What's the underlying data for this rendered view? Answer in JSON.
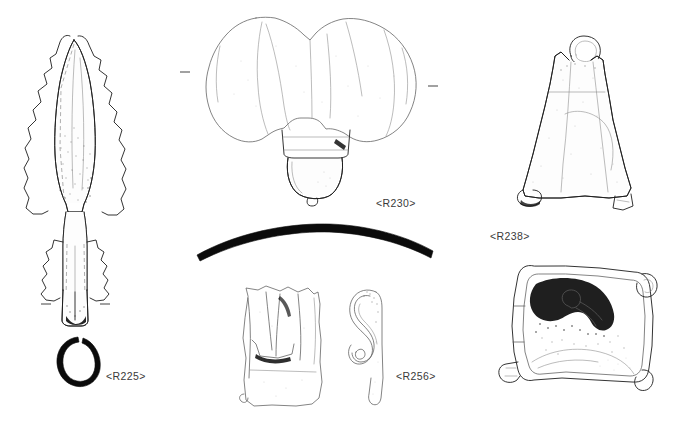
{
  "plate": {
    "title": "Archaeological small finds illustration plate",
    "background_color": "#ffffff",
    "ink_color": "#1d1d1d",
    "label_color": "#3a3a3a",
    "width": 677,
    "height": 435,
    "technique": "pen-and-ink stipple and line drawing"
  },
  "figures": [
    {
      "id": "R225",
      "label": "<R225>",
      "object_name": "socketed spearhead",
      "views": [
        "plan view",
        "socket cross-section"
      ],
      "description": "Leaf-shaped socketed spearhead with corroded irregular edges, midrib indicated by dashed construction lines and a closed socket with a split seam.",
      "label_position": {
        "x": 106,
        "y": 370
      },
      "notes": "Tick marks flank the socket base; annular black cross-section below."
    },
    {
      "id": "R230",
      "label": "<R230>",
      "object_name": "bi-lobed mount with bell terminal",
      "views": [
        "plan view"
      ],
      "description": "Large bi-lobed plate or mount with a collared bell-shaped terminal and small knop suspended below the centre.",
      "label_position": {
        "x": 376,
        "y": 197
      },
      "notes": "Small horizontal alignment ticks at left and right extremities."
    },
    {
      "id": "R238",
      "label": "<R238>",
      "object_name": "bell with suspension loop",
      "views": [
        "side elevation",
        "base / interior view"
      ],
      "description": "Trapezoidal sheet-metal bell with an integral suspension loop at the apex; the second view shows the square mouth with dark shading over the clapper fitting.",
      "label_position": {
        "x": 490,
        "y": 230
      },
      "notes": "Two views stacked vertically on the right of the plate."
    },
    {
      "id": "R256",
      "label": "<R256>",
      "object_name": "sheet fitting with hooked tang",
      "views": [
        "front view",
        "side profile"
      ],
      "description": "Rectangular sheet-metal plate shown in front view beside its side profile, which reveals a strongly recurved hooked tang.",
      "label_position": {
        "x": 396,
        "y": 370
      },
      "notes": "Paired front and profile views."
    },
    {
      "id": "curved-bar",
      "label": "",
      "object_name": "curved bar or binding strip",
      "views": [
        "profile"
      ],
      "description": "Solid black gently arched bar, drawn in silhouette as a section or thin binding strip.",
      "label_position": null,
      "notes": "Unlabelled; spans the centre of the plate."
    }
  ],
  "labels": {
    "r225": "<R225>",
    "r230": "<R230>",
    "r238": "<R238>",
    "r256": "<R256>"
  }
}
